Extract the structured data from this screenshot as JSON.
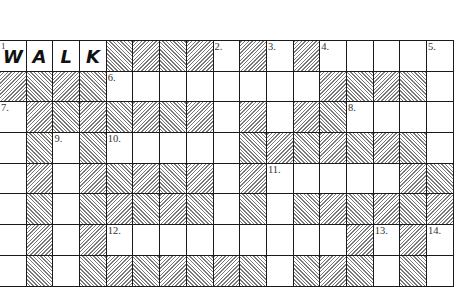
{
  "puzzle": {
    "rows": 8,
    "cols": 17,
    "grid": [
      "WWWWBBBBWBWBWWWWW",
      "BBBBWWWWWWWWBBBBW",
      "WBBBBBBBWBWBBWWWW",
      "WBWBWWWWWBBBBBBBW",
      "WBWBBBBBWBWWWWWBB",
      "WBWBBBBBWBWBBBBBB",
      "WBWBWWWWWWWWWBWBW",
      "WBWBBBBBBBWBBBWBW"
    ],
    "numbers": [
      {
        "row": 0,
        "col": 0,
        "label": "1."
      },
      {
        "row": 0,
        "col": 8,
        "label": "2."
      },
      {
        "row": 0,
        "col": 10,
        "label": "3."
      },
      {
        "row": 0,
        "col": 12,
        "label": "4."
      },
      {
        "row": 0,
        "col": 16,
        "label": "5."
      },
      {
        "row": 1,
        "col": 4,
        "label": "6."
      },
      {
        "row": 2,
        "col": 0,
        "label": "7."
      },
      {
        "row": 2,
        "col": 13,
        "label": "8."
      },
      {
        "row": 3,
        "col": 2,
        "label": "9."
      },
      {
        "row": 3,
        "col": 4,
        "label": "10."
      },
      {
        "row": 4,
        "col": 10,
        "label": "11."
      },
      {
        "row": 6,
        "col": 4,
        "label": "12."
      },
      {
        "row": 6,
        "col": 14,
        "label": "13."
      },
      {
        "row": 6,
        "col": 16,
        "label": "14."
      }
    ],
    "letters": [
      {
        "row": 0,
        "col": 0,
        "value": "W"
      },
      {
        "row": 0,
        "col": 1,
        "value": "A"
      },
      {
        "row": 0,
        "col": 2,
        "value": "L"
      },
      {
        "row": 0,
        "col": 3,
        "value": "K"
      }
    ],
    "first_number_label": "1",
    "colors": {
      "grid_line": "#1a1a1a",
      "hatch": "#7a7a7a",
      "background": "#ffffff",
      "letter": "#111111"
    }
  }
}
